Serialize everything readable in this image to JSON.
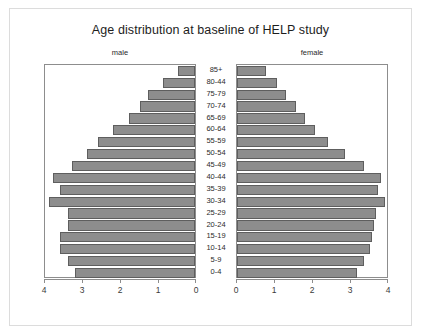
{
  "figure": {
    "title": "Age distribution at baseline of HELP study",
    "panel_titles": {
      "male": "male",
      "female": "female"
    }
  },
  "chart_data": {
    "type": "bar",
    "subtype": "population-pyramid",
    "title": "Age distribution at baseline of HELP study",
    "xlabel": "",
    "ylabel": "",
    "grid": false,
    "legend": "none",
    "orientation": "horizontal",
    "panels": [
      {
        "name": "male",
        "title": "male",
        "axis_direction": "reversed",
        "xlim": [
          4,
          0
        ],
        "xticks": [
          4,
          3,
          2,
          1,
          0
        ]
      },
      {
        "name": "female",
        "title": "female",
        "axis_direction": "normal",
        "xlim": [
          0,
          4
        ],
        "xticks": [
          0,
          1,
          2,
          3,
          4
        ]
      }
    ],
    "categories": [
      "85+",
      "80-44",
      "75-79",
      "70-74",
      "65-69",
      "60-64",
      "55-59",
      "50-54",
      "45-49",
      "40-44",
      "35-39",
      "30-34",
      "25-29",
      "20-24",
      "15-19",
      "10-14",
      "5-9",
      "0-4"
    ],
    "series": [
      {
        "name": "male",
        "values": [
          0.45,
          0.85,
          1.25,
          1.45,
          1.75,
          2.15,
          2.55,
          2.85,
          3.25,
          3.75,
          3.55,
          3.85,
          3.35,
          3.35,
          3.55,
          3.55,
          3.35,
          3.15
        ]
      },
      {
        "name": "female",
        "values": [
          0.75,
          1.05,
          1.3,
          1.55,
          1.8,
          2.05,
          2.4,
          2.85,
          3.35,
          3.8,
          3.7,
          3.9,
          3.65,
          3.6,
          3.55,
          3.5,
          3.35,
          3.15
        ]
      }
    ]
  }
}
